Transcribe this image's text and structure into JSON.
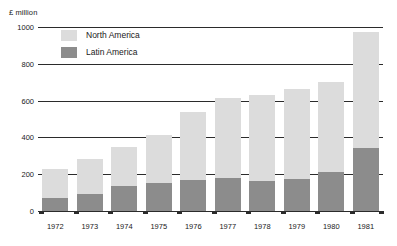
{
  "chart_data": {
    "type": "bar",
    "title": "",
    "subtitle": "",
    "ylabel": "£ million",
    "xlabel": "",
    "ylim": [
      0,
      1000
    ],
    "ytick_step": 200,
    "yticks": [
      "0",
      "200",
      "400",
      "600",
      "800",
      "1000"
    ],
    "grid": true,
    "stacked": true,
    "legend_position": "top-left-inside",
    "categories": [
      "1972",
      "1973",
      "1974",
      "1975",
      "1976",
      "1977",
      "1978",
      "1979",
      "1980",
      "1981"
    ],
    "series": [
      {
        "name": "Latin America",
        "color": "#8c8c8c",
        "values": [
          70,
          90,
          135,
          150,
          168,
          178,
          162,
          175,
          210,
          345
        ]
      },
      {
        "name": "North America",
        "color": "#dcdcdc",
        "values": [
          160,
          195,
          215,
          265,
          372,
          437,
          468,
          490,
          490,
          630
        ]
      }
    ],
    "totals": [
      230,
      285,
      350,
      415,
      540,
      615,
      630,
      665,
      700,
      975
    ]
  },
  "axis": {
    "title": "£ million"
  },
  "legend": {
    "items": [
      {
        "label": "North America",
        "swatch": "north"
      },
      {
        "label": "Latin America",
        "swatch": "latin"
      }
    ]
  },
  "colors": {
    "north_america": "#dcdcdc",
    "latin_america": "#8c8c8c",
    "gridline": "#2b2b2b",
    "text": "#1a1a1a",
    "background": "#ffffff"
  }
}
